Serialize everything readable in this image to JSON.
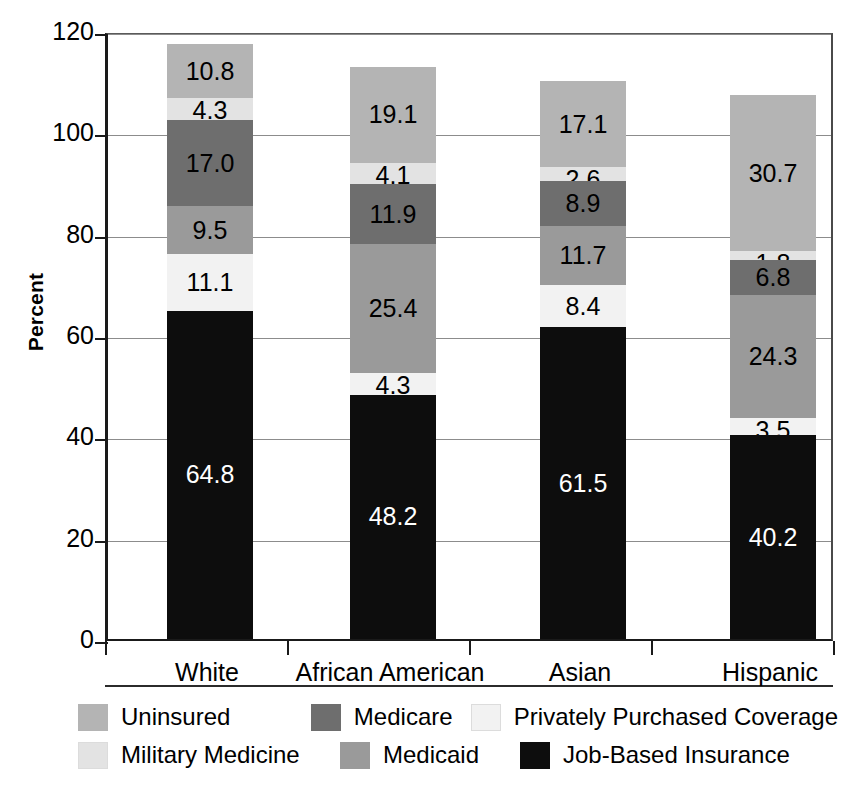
{
  "axes": {
    "ylabel": "Percent",
    "yticks": [
      "0",
      "20",
      "40",
      "60",
      "80",
      "100",
      "120"
    ],
    "ylim": [
      0,
      120
    ],
    "xticklabels": [
      "White",
      "African American",
      "Asian",
      "Hispanic"
    ]
  },
  "legend": {
    "entries": [
      {
        "label": "Uninsured",
        "color": "#b4b4b4"
      },
      {
        "label": "Medicare",
        "color": "#6e6e6e"
      },
      {
        "label": "Privately Purchased Coverage",
        "color": "#f2f2f2"
      },
      {
        "label": "Military Medicine",
        "color": "#e3e3e3"
      },
      {
        "label": "Medicaid",
        "color": "#9a9a9a"
      },
      {
        "label": "Job-Based Insurance",
        "color": "#0d0d0d"
      }
    ]
  },
  "chart_data": {
    "type": "bar",
    "stacked": true,
    "title": "",
    "xlabel": "",
    "ylabel": "Percent",
    "ylim": [
      0,
      120
    ],
    "ytick_step": 20,
    "grid": true,
    "legend_position": "bottom",
    "categories": [
      "White",
      "African American",
      "Asian",
      "Hispanic"
    ],
    "series": [
      {
        "name": "Job-Based Insurance",
        "color": "#0d0d0d",
        "label_color": "#ffffff",
        "values": [
          64.8,
          48.2,
          61.5,
          40.2
        ]
      },
      {
        "name": "Privately Purchased Coverage",
        "color": "#f2f2f2",
        "label_color": "#000000",
        "values": [
          11.1,
          4.3,
          8.4,
          3.5
        ]
      },
      {
        "name": "Medicaid",
        "color": "#9a9a9a",
        "label_color": "#000000",
        "values": [
          9.5,
          25.4,
          11.7,
          24.3
        ]
      },
      {
        "name": "Medicare",
        "color": "#6e6e6e",
        "label_color": "#000000",
        "values": [
          17.0,
          11.9,
          8.9,
          6.8
        ]
      },
      {
        "name": "Military Medicine",
        "color": "#e3e3e3",
        "label_color": "#000000",
        "values": [
          4.3,
          4.1,
          2.6,
          1.8
        ]
      },
      {
        "name": "Uninsured",
        "color": "#b4b4b4",
        "label_color": "#000000",
        "values": [
          10.8,
          19.1,
          17.1,
          30.7
        ]
      }
    ],
    "totals": [
      117.5,
      113.0,
      110.2,
      107.3
    ]
  }
}
